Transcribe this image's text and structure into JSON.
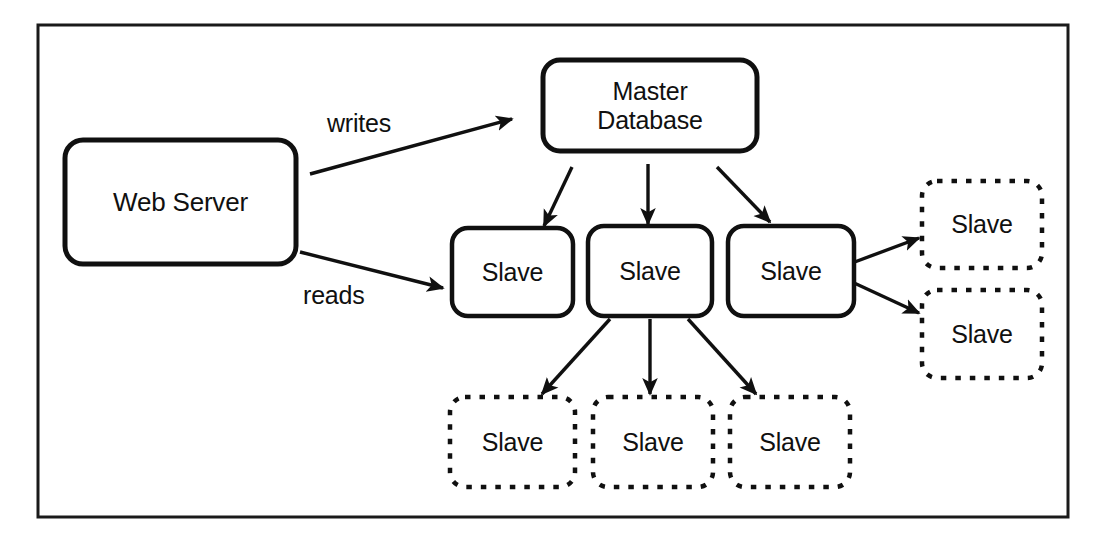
{
  "diagram": {
    "kind": "architecture-diagram",
    "frame": {
      "x": 38,
      "y": 25,
      "width": 1030,
      "height": 492,
      "stroke": "#1a1a1a",
      "stroke_width": 3
    },
    "colors": {
      "background": "#ffffff",
      "stroke": "#101010",
      "text": "#101010",
      "solid_node_stroke": "#101010",
      "dashed_node_stroke": "#101010"
    },
    "nodes": [
      {
        "id": "web-server",
        "label": "Web Server",
        "style": "solid",
        "x": 65,
        "y": 140,
        "width": 231,
        "height": 124,
        "radius": 18,
        "stroke_width": 5,
        "font_size": 26
      },
      {
        "id": "master-database",
        "label": "Master\nDatabase",
        "style": "solid",
        "x": 543,
        "y": 60,
        "width": 214,
        "height": 91,
        "radius": 17,
        "stroke_width": 5,
        "font_size": 25
      },
      {
        "id": "slave-mid-1",
        "label": "Slave",
        "style": "solid",
        "x": 452,
        "y": 228,
        "width": 121,
        "height": 88,
        "radius": 16,
        "stroke_width": 4.5,
        "font_size": 25
      },
      {
        "id": "slave-mid-2",
        "label": "Slave",
        "style": "solid",
        "x": 588,
        "y": 226,
        "width": 124,
        "height": 90,
        "radius": 16,
        "stroke_width": 4.5,
        "font_size": 25
      },
      {
        "id": "slave-mid-3",
        "label": "Slave",
        "style": "solid",
        "x": 728,
        "y": 226,
        "width": 126,
        "height": 90,
        "radius": 16,
        "stroke_width": 4.5,
        "font_size": 25
      },
      {
        "id": "slave-right-1",
        "label": "Slave",
        "style": "dashed",
        "x": 922,
        "y": 181,
        "width": 120,
        "height": 87,
        "radius": 15,
        "stroke_width": 4.5,
        "font_size": 25
      },
      {
        "id": "slave-right-2",
        "label": "Slave",
        "style": "dashed",
        "x": 922,
        "y": 290,
        "width": 120,
        "height": 88,
        "radius": 15,
        "stroke_width": 4.5,
        "font_size": 25
      },
      {
        "id": "slave-bottom-1",
        "label": "Slave",
        "style": "dashed",
        "x": 450,
        "y": 397,
        "width": 125,
        "height": 90,
        "radius": 15,
        "stroke_width": 4.5,
        "font_size": 25
      },
      {
        "id": "slave-bottom-2",
        "label": "Slave",
        "style": "dashed",
        "x": 593,
        "y": 397,
        "width": 120,
        "height": 90,
        "radius": 15,
        "stroke_width": 4.5,
        "font_size": 25
      },
      {
        "id": "slave-bottom-3",
        "label": "Slave",
        "style": "dashed",
        "x": 730,
        "y": 397,
        "width": 120,
        "height": 90,
        "radius": 15,
        "stroke_width": 4.5,
        "font_size": 25
      }
    ],
    "edges": [
      {
        "id": "writes",
        "from": "web-server",
        "to": "master-database",
        "label": "writes",
        "x1": 310,
        "y1": 174,
        "x2": 512,
        "y2": 119
      },
      {
        "id": "reads",
        "from": "web-server",
        "to": "slave-mid-1",
        "label": "reads",
        "x1": 300,
        "y1": 252,
        "x2": 443,
        "y2": 288
      },
      {
        "id": "master-to-slave-1",
        "from": "master-database",
        "to": "slave-mid-1",
        "label": "",
        "x1": 572,
        "y1": 167,
        "x2": 544,
        "y2": 226
      },
      {
        "id": "master-to-slave-2",
        "from": "master-database",
        "to": "slave-mid-2",
        "label": "",
        "x1": 648,
        "y1": 164,
        "x2": 648,
        "y2": 224
      },
      {
        "id": "master-to-slave-3",
        "from": "master-database",
        "to": "slave-mid-3",
        "label": "",
        "x1": 717,
        "y1": 167,
        "x2": 770,
        "y2": 222
      },
      {
        "id": "slave-mid-2-to-bottom-1",
        "from": "slave-mid-2",
        "to": "slave-bottom-1",
        "label": "",
        "x1": 610,
        "y1": 319,
        "x2": 542,
        "y2": 394
      },
      {
        "id": "slave-mid-2-to-bottom-2",
        "from": "slave-mid-2",
        "to": "slave-bottom-2",
        "label": "",
        "x1": 650,
        "y1": 319,
        "x2": 650,
        "y2": 394
      },
      {
        "id": "slave-mid-2-to-bottom-3",
        "from": "slave-mid-2",
        "to": "slave-bottom-3",
        "label": "",
        "x1": 688,
        "y1": 319,
        "x2": 756,
        "y2": 394
      },
      {
        "id": "slave-mid-3-to-right-1",
        "from": "slave-mid-3",
        "to": "slave-right-1",
        "label": "",
        "x1": 852,
        "y1": 263,
        "x2": 919,
        "y2": 238
      },
      {
        "id": "slave-mid-3-to-right-2",
        "from": "slave-mid-3",
        "to": "slave-right-2",
        "label": "",
        "x1": 852,
        "y1": 282,
        "x2": 919,
        "y2": 313
      }
    ],
    "edge_labels": [
      {
        "id": "writes-label",
        "text": "writes",
        "x": 327,
        "y": 109
      },
      {
        "id": "reads-label",
        "text": "reads",
        "x": 303,
        "y": 281
      }
    ]
  }
}
